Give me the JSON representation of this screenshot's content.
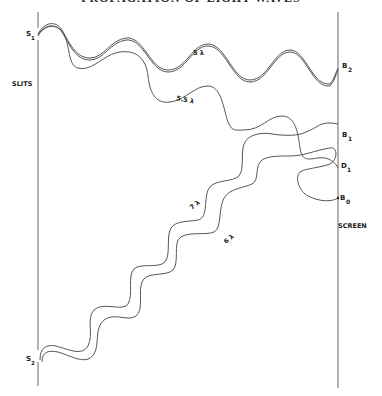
{
  "figure": {
    "title_partial": "PROPAGATION OF LIGHT WAVES",
    "slits_label": "SLITS",
    "screen_label": "SCREEN",
    "sources": [
      {
        "id": "s1",
        "letter": "S",
        "sub": "1"
      },
      {
        "id": "s2",
        "letter": "S",
        "sub": "2"
      }
    ],
    "screen_points": [
      {
        "id": "b2",
        "letter": "B",
        "sub": "2"
      },
      {
        "id": "b1",
        "letter": "B",
        "sub": "1"
      },
      {
        "id": "d1",
        "letter": "D",
        "sub": "1"
      },
      {
        "id": "b0",
        "letter": "B",
        "sub": "0"
      }
    ],
    "path_labels": [
      {
        "id": "p5",
        "text": "5 λ"
      },
      {
        "id": "p55",
        "text": "5.5 λ"
      },
      {
        "id": "p7",
        "text": "7 λ"
      },
      {
        "id": "p6",
        "text": "6 λ"
      }
    ],
    "colors": {
      "line": "#555555",
      "text": "#222222"
    }
  }
}
